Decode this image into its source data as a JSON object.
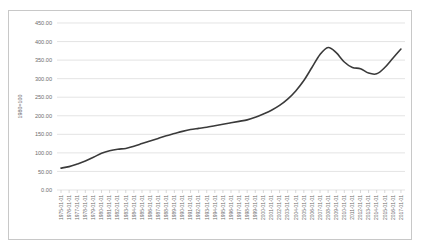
{
  "chart_data": {
    "type": "line",
    "title": "",
    "xlabel": "",
    "ylabel": "1980=100",
    "ylim": [
      0,
      450
    ],
    "ytick_labels": [
      "0.00",
      "50.00",
      "100.00",
      "150.00",
      "200.00",
      "250.00",
      "300.00",
      "350.00",
      "400.00",
      "450.00"
    ],
    "ytick_values": [
      0,
      50,
      100,
      150,
      200,
      250,
      300,
      350,
      400,
      450
    ],
    "grid": true,
    "legend": "none",
    "x": [
      "1975-01-01",
      "1976-01-01",
      "1977-01-01",
      "1978-01-01",
      "1979-01-01",
      "1980-01-01",
      "1981-01-01",
      "1982-01-01",
      "1983-01-01",
      "1984-01-01",
      "1985-01-01",
      "1986-01-01",
      "1987-01-01",
      "1988-01-01",
      "1989-01-01",
      "1990-01-01",
      "1991-01-01",
      "1992-01-01",
      "1993-01-01",
      "1994-01-01",
      "1995-01-01",
      "1996-01-01",
      "1997-01-01",
      "1998-01-01",
      "1999-01-01",
      "2000-01-01",
      "2001-01-01",
      "2002-01-01",
      "2003-01-01",
      "2004-01-01",
      "2005-01-01",
      "2006-01-01",
      "2007-01-01",
      "2008-01-01",
      "2009-01-01",
      "2010-01-01",
      "2011-01-01",
      "2012-01-01",
      "2013-01-01",
      "2014-01-01",
      "2015-01-01",
      "2016-01-01",
      "2017-01-01"
    ],
    "values": [
      59,
      63,
      70,
      78,
      88,
      99,
      106,
      110,
      112,
      118,
      125,
      132,
      139,
      146,
      152,
      158,
      163,
      166,
      169,
      173,
      177,
      181,
      185,
      189,
      196,
      205,
      215,
      228,
      245,
      267,
      295,
      330,
      365,
      384,
      370,
      345,
      330,
      327,
      315,
      313,
      330,
      355,
      380
    ],
    "series_name": "index"
  }
}
